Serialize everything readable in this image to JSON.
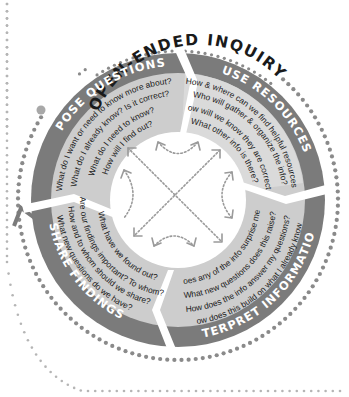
{
  "title": "OPEN-ENDED INQUIRY",
  "colors": {
    "outer_band": "#7b7b7b",
    "inner_band": "#cfcfcf",
    "inner_band_alt": "#dadada",
    "dots": "#8a8a8a",
    "frame_dots": "#b5b5b5",
    "text": "#1a1a1a",
    "band_label": "#ffffff"
  },
  "stages": [
    {
      "label": "POSE QUESTIONS",
      "questions": [
        "What do I want or need to know more about?",
        "What do I already know? Is it correct?",
        "What do I need to know?",
        "How will I find out?"
      ]
    },
    {
      "label": "USE RESOURCES",
      "questions": [
        "How & where can we find helpful resources?",
        "Who will gather & organize the info?",
        "How will we know they are correct?",
        "What other info is there?"
      ]
    },
    {
      "label": "INTERPRET INFORMATION",
      "questions": [
        "Does any of the info surprise me?",
        "What new questions does this raise?",
        "How does the info answer my questions?",
        "How does this build on what I already know?"
      ]
    },
    {
      "label": "SHARE FINDINGS",
      "questions": [
        "What have we found out?",
        "Are our findings important? To whom?",
        "How and to whom should we share?",
        "What new questions do we have?"
      ]
    }
  ],
  "center_icons": [
    "curved-arrow-top",
    "curved-arrow-right",
    "curved-arrow-bottom",
    "curved-arrow-left",
    "cross-arrows"
  ],
  "cycle_arrow_icon": "cycle-arrow-icon"
}
